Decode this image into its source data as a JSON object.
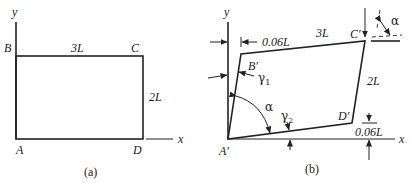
{
  "figure_a": {
    "caption": "(a)",
    "axis_x": "x",
    "axis_y": "y",
    "corners": {
      "A": "A",
      "B": "B",
      "C": "C",
      "D": "D"
    },
    "dimensions": {
      "top": "3L",
      "right": "2L"
    }
  },
  "figure_b": {
    "caption": "(b)",
    "axis_x": "x",
    "axis_y": "y",
    "corners": {
      "A": "A′",
      "B": "B′",
      "C": "C′",
      "D": "D′"
    },
    "dimensions": {
      "top": "3L",
      "right": "2L",
      "horizontal_offset": "0.06L",
      "vertical_offset": "0.06L"
    },
    "angles": {
      "alpha": "α",
      "alpha_corner": "α",
      "gamma1": "γ",
      "gamma1_sub": "1",
      "gamma2": "γ",
      "gamma2_sub": "2"
    }
  }
}
